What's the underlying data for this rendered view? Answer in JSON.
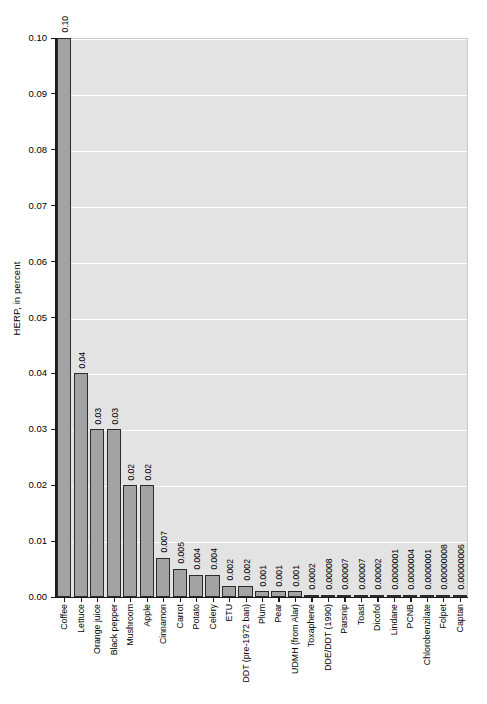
{
  "chart_data": {
    "type": "bar",
    "title": "",
    "subtitle": "",
    "xlabel": "",
    "ylabel": "HERP, in percent",
    "ylim": [
      0.0,
      0.1
    ],
    "grid": true,
    "legend": "none",
    "orientation": "vertical",
    "value_labels_shown": true,
    "yticks": [
      "0.00",
      "0.01",
      "0.02",
      "0.03",
      "0.04",
      "0.05",
      "0.06",
      "0.07",
      "0.08",
      "0.09",
      "0.10"
    ],
    "ytick_values": [
      0.0,
      0.01,
      0.02,
      0.03,
      0.04,
      0.05,
      0.06,
      0.07,
      0.08,
      0.09,
      0.1
    ],
    "categories": [
      "Coffee",
      "Lettuce",
      "Orange juice",
      "Black pepper",
      "Mushroom",
      "Apple",
      "Cinnamon",
      "Carrot",
      "Potato",
      "Celery",
      "ETU",
      "DDT (pre-1972 ban)",
      "Plum",
      "Pear",
      "UDMH (from Alar)",
      "Toxaphene",
      "DDE/DDT (1990)",
      "Parsnip",
      "Toast",
      "Dicofol",
      "Lindane",
      "PCNB",
      "Chlorobenzilate",
      "Folpet",
      "Captan"
    ],
    "values": [
      0.1,
      0.04,
      0.03,
      0.03,
      0.02,
      0.02,
      0.007,
      0.005,
      0.004,
      0.004,
      0.002,
      0.002,
      0.001,
      0.001,
      0.001,
      0.0002,
      8e-05,
      7e-05,
      7e-05,
      2e-05,
      1e-07,
      4e-07,
      1e-07,
      8e-08,
      6e-08
    ],
    "value_labels": [
      "0.10",
      "0.04",
      "0.03",
      "0.03",
      "0.02",
      "0.02",
      "0.007",
      "0.005",
      "0.004",
      "0.004",
      "0.002",
      "0.002",
      "0.001",
      "0.001",
      "0.001",
      "0.0002",
      "0.00008",
      "0.00007",
      "0.00007",
      "0.00002",
      "0.0000001",
      "0.0000004",
      "0.0000001",
      "0.00000008",
      "0.00000006"
    ]
  },
  "style": {
    "bar_fill": "#a3a3a3",
    "bar_edge": "#2b2b2b",
    "plot_background": "#e3e3e3",
    "gridline_color": "#ffffff",
    "axis_color": "#1a1a1a",
    "page_background": "#ffffff",
    "text_color": "#000000"
  }
}
